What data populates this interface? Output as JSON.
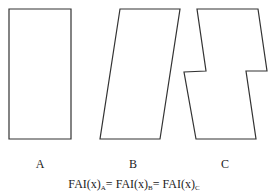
{
  "diagram": {
    "shapes": [
      {
        "id": "A",
        "label": "A",
        "kind": "rectangle",
        "points": "9,9 71,9 71,139 9,139"
      },
      {
        "id": "B",
        "label": "B",
        "kind": "parallelogram",
        "points": "120,9 180,9 160,139 100,139"
      },
      {
        "id": "C",
        "label": "C",
        "kind": "notched-parallelogram",
        "points": "197,9 258,9 267,71 246,71 256,139 196,139 184,72 206,71"
      }
    ],
    "stroke_color": "#333333",
    "labels": {
      "a": "A",
      "b": "B",
      "c": "C"
    },
    "formula": {
      "part1": "FAI(x)",
      "sub1": "A",
      "eq1": "= FAI(x)",
      "sub2": "B",
      "eq2": "= FAI(x)",
      "sub3": "C"
    }
  }
}
